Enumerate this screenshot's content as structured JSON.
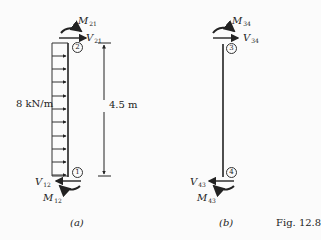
{
  "figure": {
    "caption": "Fig. 12.8",
    "panels": [
      {
        "id": "a",
        "label": "(a)",
        "load_label": "8 kN/m",
        "dimension_label": "4.5 m",
        "nodes": [
          "2",
          "1"
        ],
        "top_moment": {
          "symbol": "M",
          "sub": "21"
        },
        "top_shear": {
          "symbol": "V",
          "sub": "21"
        },
        "bottom_moment": {
          "symbol": "M",
          "sub": "12"
        },
        "bottom_shear": {
          "symbol": "V",
          "sub": "12"
        }
      },
      {
        "id": "b",
        "label": "(b)",
        "nodes": [
          "3",
          "4"
        ],
        "top_moment": {
          "symbol": "M",
          "sub": "34"
        },
        "top_shear": {
          "symbol": "V",
          "sub": "34"
        },
        "bottom_moment": {
          "symbol": "M",
          "sub": "43"
        },
        "bottom_shear": {
          "symbol": "V",
          "sub": "43"
        }
      }
    ],
    "colors": {
      "ink": "#222222",
      "background": "#fbfbfb"
    }
  }
}
